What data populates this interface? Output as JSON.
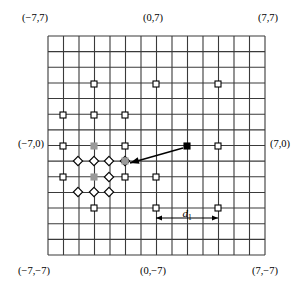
{
  "figure": {
    "title": "",
    "grid": {
      "x0": 48,
      "y0": 36,
      "x1": 265,
      "y1": 255,
      "cols": 14,
      "rows": 14,
      "line_color": "#3a3a3a",
      "line_width": 1.1
    },
    "coordinate_range": {
      "xmin": -7,
      "xmax": 7,
      "ymin": -7,
      "ymax": 7
    },
    "corner_labels": [
      {
        "name": "top-left",
        "text": "(−7,7)",
        "x": 22,
        "y": 19
      },
      {
        "name": "top-center",
        "text": "(0,7)",
        "x": 143,
        "y": 19
      },
      {
        "name": "top-right",
        "text": "(7,7)",
        "x": 258,
        "y": 19
      },
      {
        "name": "left-middle",
        "text": "(−7,0)",
        "x": 18,
        "y": 145
      },
      {
        "name": "right-middle",
        "text": "(7,0)",
        "x": 270,
        "y": 145
      },
      {
        "name": "bottom-left",
        "text": "(−7,−7)",
        "x": 18,
        "y": 272
      },
      {
        "name": "bottom-center",
        "text": "(0,−7)",
        "x": 140,
        "y": 272
      },
      {
        "name": "bottom-right",
        "text": "(7,−7)",
        "x": 252,
        "y": 272
      }
    ],
    "distance_annotation": {
      "label_main": "d",
      "label_sub": "1",
      "from_x": 156,
      "to_x": 218,
      "y": 218,
      "color": "#000000"
    },
    "markers": {
      "open_square": {
        "shape": "square",
        "fill": "#ffffff",
        "stroke": "#000000",
        "size": 6,
        "points": [
          [
            94,
            84
          ],
          [
            156,
            84
          ],
          [
            218,
            84
          ],
          [
            63,
            115
          ],
          [
            94,
            115
          ],
          [
            125,
            115
          ],
          [
            63,
            146
          ],
          [
            125,
            146
          ],
          [
            218,
            146
          ],
          [
            63,
            177
          ],
          [
            125,
            177
          ],
          [
            156,
            177
          ],
          [
            94,
            208
          ],
          [
            156,
            208
          ],
          [
            218,
            208
          ]
        ]
      },
      "open_diamond": {
        "shape": "diamond",
        "fill": "#ffffff",
        "stroke": "#000000",
        "size": 6,
        "points": [
          [
            78,
            161
          ],
          [
            94,
            161
          ],
          [
            109,
            161
          ],
          [
            125,
            161
          ],
          [
            109,
            177
          ],
          [
            78,
            192
          ],
          [
            94,
            192
          ],
          [
            109,
            192
          ]
        ]
      },
      "gray_filled": {
        "shape": "square",
        "fill": "#9a9a9a",
        "stroke": "#9a9a9a",
        "size": 6,
        "points": [
          [
            94,
            146
          ],
          [
            125,
            161
          ],
          [
            94,
            177
          ]
        ]
      },
      "black_filled": {
        "shape": "square",
        "fill": "#000000",
        "stroke": "#000000",
        "size": 6,
        "points": [
          [
            187,
            146
          ]
        ]
      }
    },
    "arrow": {
      "name": "displacement-arrow",
      "from": [
        183,
        148
      ],
      "to": [
        130,
        163
      ],
      "color": "#000000",
      "width": 1.4
    }
  }
}
